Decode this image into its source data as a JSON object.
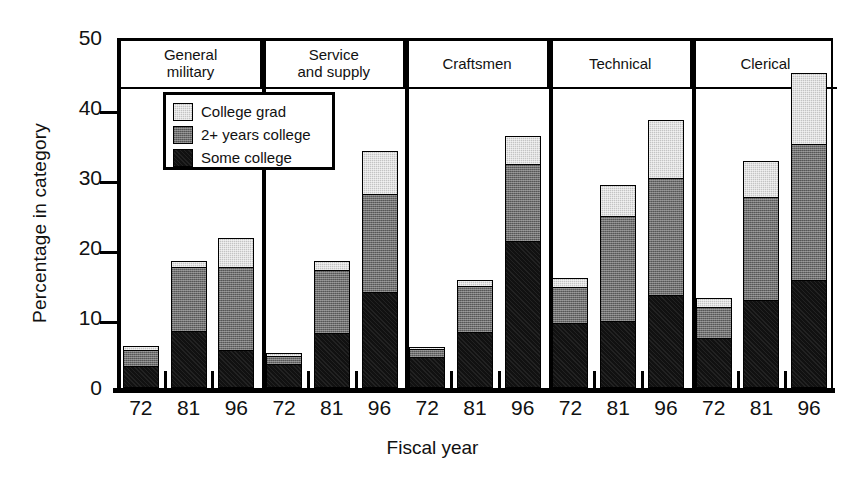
{
  "chart_data": {
    "type": "bar",
    "stacked": true,
    "title": "",
    "xlabel": "Fiscal year",
    "ylabel": "Percentage in category",
    "ylim": [
      0,
      50
    ],
    "yticks": [
      0,
      10,
      20,
      30,
      40,
      50
    ],
    "grid": false,
    "legend_position": "upper-left-inside",
    "series": [
      {
        "name": "Some college",
        "color": "#111111"
      },
      {
        "name": "2+ years college",
        "color": "#6e6e6e"
      },
      {
        "name": "College grad",
        "color": "#c3c3c3"
      }
    ],
    "groups": [
      {
        "label": "General\nmilitary",
        "label_line1": "General",
        "label_line2": "military",
        "categories": [
          "72",
          "81",
          "96"
        ],
        "values": {
          "Some college": [
            3.0,
            8.0,
            5.3
          ],
          "2+ years college": [
            2.6,
            9.4,
            12.0
          ],
          "College grad": [
            0.4,
            0.8,
            4.2
          ]
        },
        "totals": [
          6.0,
          18.2,
          21.5
        ]
      },
      {
        "label": "Service\nand supply",
        "label_line1": "Service",
        "label_line2": "and supply",
        "categories": [
          "72",
          "81",
          "96"
        ],
        "values": {
          "Some college": [
            3.3,
            7.7,
            13.6
          ],
          "2+ years college": [
            1.4,
            9.3,
            14.2
          ],
          "College grad": [
            0.3,
            1.2,
            6.0
          ]
        },
        "totals": [
          5.0,
          18.2,
          33.8
        ]
      },
      {
        "label": "Craftsmen",
        "label_line1": "Craftsmen",
        "label_line2": "",
        "categories": [
          "72",
          "81",
          "96"
        ],
        "values": {
          "Some college": [
            4.3,
            7.9,
            20.8
          ],
          "2+ years college": [
            1.4,
            6.8,
            11.3
          ],
          "College grad": [
            0.2,
            0.8,
            3.9
          ]
        },
        "totals": [
          5.9,
          15.5,
          36.0
        ]
      },
      {
        "label": "Technical",
        "label_line1": "Technical",
        "label_line2": "",
        "categories": [
          "72",
          "81",
          "96"
        ],
        "values": {
          "Some college": [
            9.1,
            9.5,
            13.1
          ],
          "2+ years college": [
            5.4,
            15.1,
            16.9
          ],
          "College grad": [
            1.2,
            4.4,
            8.3
          ]
        },
        "totals": [
          15.7,
          29.0,
          38.3
        ]
      },
      {
        "label": "Clerical",
        "label_line1": "Clerical",
        "label_line2": "",
        "categories": [
          "72",
          "81",
          "96"
        ],
        "values": {
          "Some college": [
            7.0,
            12.5,
            15.3
          ],
          "2+ years college": [
            4.6,
            14.9,
            19.6
          ],
          "College grad": [
            1.3,
            5.0,
            10.1
          ]
        },
        "totals": [
          12.9,
          32.4,
          45.0
        ]
      }
    ]
  },
  "legend": {
    "items": [
      {
        "label": "College grad",
        "key": "grad"
      },
      {
        "label": "2+ years college",
        "key": "twoyr"
      },
      {
        "label": "Some college",
        "key": "some"
      }
    ]
  }
}
